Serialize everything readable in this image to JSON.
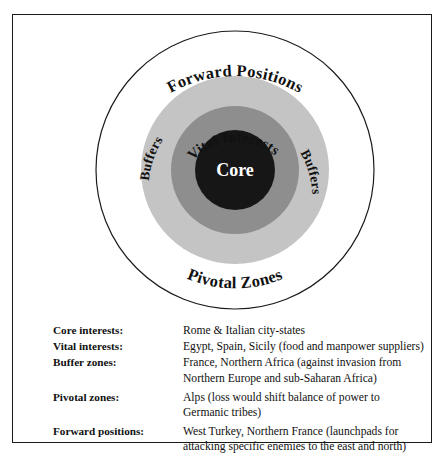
{
  "diagram": {
    "title_present": false,
    "center_label": "Core",
    "rings": [
      {
        "id": "forward-positions",
        "label": "Forward Positions",
        "position": "outer-top",
        "fill": "#ffffff"
      },
      {
        "id": "pivotal-zones",
        "label": "Pivotal Zones",
        "position": "outer-bottom",
        "fill": "#ffffff"
      },
      {
        "id": "buffers-left",
        "label": "Buffers",
        "position": "ring-left",
        "fill": "#c4c4c4"
      },
      {
        "id": "buffers-right",
        "label": "Buffers",
        "position": "ring-right",
        "fill": "#c4c4c4"
      },
      {
        "id": "vital-interests",
        "label": "Vital Interests",
        "position": "ring-inner-top",
        "fill": "#8e8e8e"
      },
      {
        "id": "core",
        "label": "Core",
        "position": "center",
        "fill": "#161616"
      }
    ],
    "colors": {
      "outer_circle_stroke": "#1a1a1a",
      "buffer_ring": "#c4c4c4",
      "vital_ring": "#8e8e8e",
      "core": "#161616",
      "core_text": "#ffffff",
      "label_text": "#111111",
      "frame_border": "#1a1a1a",
      "background": "#ffffff"
    }
  },
  "legend": {
    "rows": [
      {
        "term": "Core interests:",
        "lines": [
          "Rome & Italian city-states"
        ]
      },
      {
        "term": "Vital interests:",
        "lines": [
          "Egypt, Spain, Sicily (food and manpower suppliers)"
        ]
      },
      {
        "term": "Buffer zones:",
        "lines": [
          "France, Northern Africa (against invasion from",
          "Northern Europe and sub-Saharan Africa)"
        ]
      },
      {
        "term": "Pivotal zones:",
        "lines": [
          "Alps (loss would shift balance of power to",
          "Germanic tribes)"
        ]
      },
      {
        "term": "Forward positions:",
        "lines": [
          "West Turkey, Northern France (launchpads for",
          "attacking specific enemies to the east and north)"
        ]
      }
    ]
  }
}
